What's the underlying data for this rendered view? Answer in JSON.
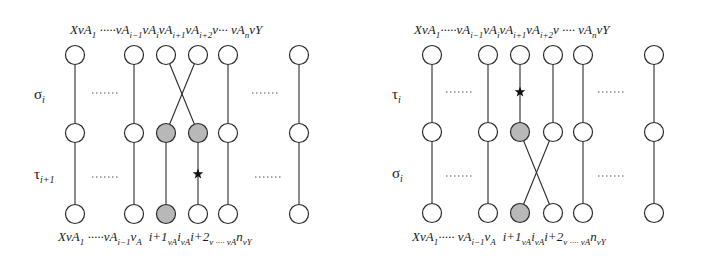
{
  "diagrams": [
    {
      "id": "left",
      "top_label": {
        "parts": [
          "XvA",
          "1",
          " ·····vA",
          "i−1",
          "vA",
          "i",
          "vA",
          "i+1",
          "vA",
          "i+2",
          "v··· vA",
          "n",
          "vY"
        ]
      },
      "bottom_label": {
        "parts": [
          "XvA",
          "1",
          " ·····vA",
          "i−1",
          "v",
          "A⃖",
          "i+1",
          "vA",
          "i",
          "vA",
          "i+2",
          "v ···· vA",
          "n",
          "vY"
        ]
      },
      "row_labels": [
        {
          "main": "σ",
          "sub": "i"
        },
        {
          "main": "τ",
          "sub": "i+1"
        }
      ],
      "columns_x": [
        75,
        134,
        166,
        198,
        228,
        299
      ],
      "rows_y": [
        55,
        133,
        214
      ],
      "shaded": [
        [
          1,
          2
        ],
        [
          1,
          3
        ],
        [
          2,
          2
        ]
      ],
      "crossing": {
        "rows": [
          0,
          1
        ],
        "cols": [
          2,
          3
        ]
      },
      "star": {
        "col": 3,
        "y": 174
      },
      "dots": [
        {
          "x1": 92,
          "x2": 118,
          "y": 93
        },
        {
          "x1": 252,
          "x2": 280,
          "y": 93
        },
        {
          "x1": 92,
          "x2": 118,
          "y": 177
        },
        {
          "x1": 255,
          "x2": 283,
          "y": 177
        }
      ]
    },
    {
      "id": "right",
      "top_label": {
        "parts": [
          "XvA",
          "1",
          "·····vA",
          "i−1",
          "vA",
          "i",
          "vA",
          "i+1",
          "vA",
          "i+2",
          "v ···· vA",
          "n",
          "vY"
        ]
      },
      "bottom_label": {
        "parts": [
          "XvA",
          "1",
          "····· vA",
          "i−1",
          "v",
          "A⃖",
          "i+1",
          "vA",
          "i",
          "vA",
          "i+2",
          "v ···· vA",
          "n",
          "vY"
        ]
      },
      "row_labels": [
        {
          "main": "τ",
          "sub": "i"
        },
        {
          "main": "σ",
          "sub": "i"
        }
      ],
      "columns_x": [
        432,
        488,
        520,
        553,
        583,
        654
      ],
      "rows_y": [
        55,
        132,
        213
      ],
      "shaded": [
        [
          1,
          2
        ],
        [
          2,
          2
        ]
      ],
      "crossing": {
        "rows": [
          1,
          2
        ],
        "cols": [
          2,
          3
        ]
      },
      "star": {
        "col": 2,
        "y": 92
      },
      "dots": [
        {
          "x1": 446,
          "x2": 472,
          "y": 92
        },
        {
          "x1": 598,
          "x2": 626,
          "y": 92
        },
        {
          "x1": 446,
          "x2": 472,
          "y": 176
        },
        {
          "x1": 598,
          "x2": 626,
          "y": 176
        }
      ]
    }
  ],
  "layout": {
    "node_radius": 9.5,
    "top_label_y": 34,
    "bottom_label_y": 241,
    "left": {
      "top_label_x": 70,
      "bottom_label_x": 58,
      "row_label_x": 34
    },
    "right": {
      "top_label_x": 414,
      "bottom_label_x": 412,
      "row_label_x": 392
    }
  }
}
